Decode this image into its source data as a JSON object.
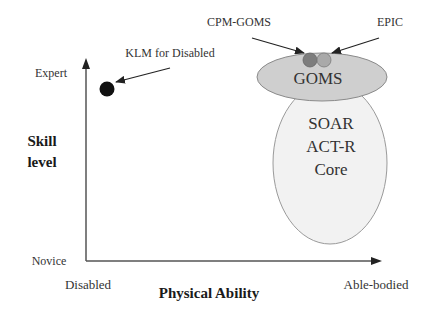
{
  "diagram": {
    "y_axis": {
      "title_line1": "Skill",
      "title_line2": "level",
      "top_label": "Expert",
      "bottom_label": "Novice"
    },
    "x_axis": {
      "title": "Physical Ability",
      "left_label": "Disabled",
      "right_label": "Able-bodied"
    },
    "regions": {
      "goms": {
        "label": "GOMS",
        "fill": "#cfcfcf",
        "stroke": "#8a8a8a"
      },
      "core": {
        "line1": "SOAR",
        "line2": "ACT-R",
        "line3": "Core",
        "fill": "#f2f2f2",
        "stroke": "#9a9a9a"
      }
    },
    "points": {
      "klm": {
        "label": "KLM for Disabled",
        "fill": "#111111"
      },
      "cpm_goms": {
        "label": "CPM-GOMS",
        "fill": "#7d7d7d"
      },
      "epic": {
        "label": "EPIC",
        "fill": "#a9a9a9"
      }
    },
    "colors": {
      "axis": "#555555",
      "arrow": "#222222"
    }
  }
}
